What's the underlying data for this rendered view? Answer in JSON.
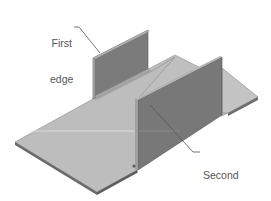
{
  "figure": {
    "labels": {
      "first_edge": {
        "line1": "First",
        "line2": "edge"
      },
      "second_edge": {
        "line1": "Second",
        "line2": "edge"
      }
    },
    "colors": {
      "plate_top": "#bdbdbd",
      "plate_edge": "#6e6e6e",
      "flange_face": "#7a7a7a",
      "flange_top": "#a8a8a8",
      "leader": "#555555",
      "text": "#555555"
    }
  }
}
